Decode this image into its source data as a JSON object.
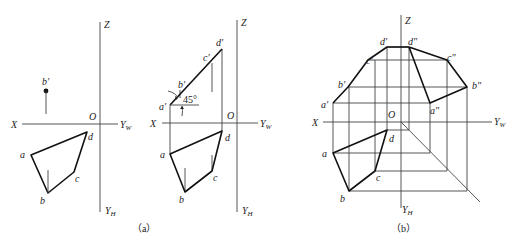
{
  "figure": {
    "panel_a": {
      "caption": "（a）",
      "left": {
        "axes": {
          "z_label": "Z",
          "x_label": "X",
          "yw_label": "Y",
          "yw_sub": "W",
          "yh_label": "Y",
          "yh_sub": "H",
          "origin_label": "O"
        },
        "point_labels": {
          "b_prime": "b′",
          "a": "a",
          "b": "b",
          "c": "c",
          "d": "d"
        }
      },
      "right": {
        "axes": {
          "z_label": "Z",
          "x_label": "X",
          "yw_label": "Y",
          "yw_sub": "W",
          "yh_label": "Y",
          "yh_sub": "H",
          "origin_label": "O"
        },
        "point_labels": {
          "a_prime": "a′",
          "b_prime": "b′",
          "c_prime": "c′",
          "d_prime": "d′",
          "a": "a",
          "b": "b",
          "c": "c",
          "d": "d"
        },
        "angle_label": "45°"
      }
    },
    "panel_b": {
      "caption": "（b）",
      "axes": {
        "z_label": "Z",
        "x_label": "X",
        "yw_label": "Y",
        "yw_sub": "W",
        "yh_label": "Y",
        "yh_sub": "H",
        "origin_label": "O"
      },
      "point_labels": {
        "a_prime": "a′",
        "b_prime": "b′",
        "c_prime": "c′",
        "d_prime": "d′",
        "a_dprime": "a″",
        "b_dprime": "b″",
        "c_dprime": "c″",
        "d_dprime": "d″",
        "a": "a",
        "b": "b",
        "c": "c",
        "d": "d"
      }
    }
  }
}
